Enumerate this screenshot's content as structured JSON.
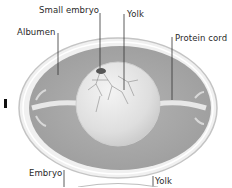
{
  "diagram": {
    "labels": {
      "small_embryo": "Small embryo",
      "yolk_top": "Yolk",
      "albumen": "Albumen",
      "protein_cord": "Protein cord",
      "embryo": "Embryo",
      "yolk_bottom": "Yolk"
    },
    "colors": {
      "shell": "#f2f2f2",
      "shell_edge": "#bdbdbd",
      "albumen": "#a9a9a9",
      "yolk": "#e6e6e6",
      "embryo": "#555555",
      "leader_line": "#333333",
      "text": "#2a2a2a"
    }
  }
}
